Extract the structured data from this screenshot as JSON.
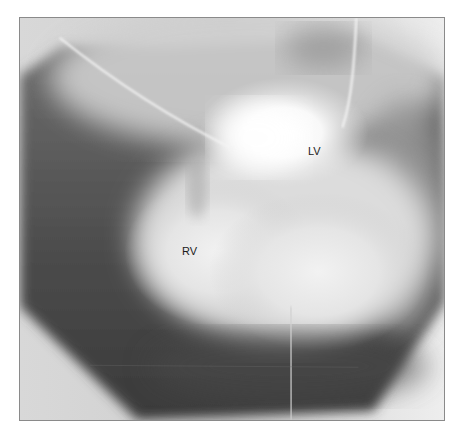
{
  "figure": {
    "type": "angiogram",
    "labels": [
      {
        "id": "lv",
        "text": "LV"
      },
      {
        "id": "rv",
        "text": "RV"
      }
    ],
    "colors": {
      "background": "#ffffff",
      "frame_border": "#8a8a8a",
      "label_text": "#1a1a1a"
    }
  }
}
